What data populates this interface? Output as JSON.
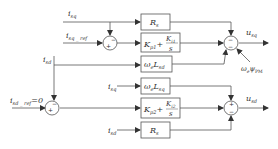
{
  "diagram": {
    "type": "block-diagram",
    "colors": {
      "line": "#555555",
      "text": "#333333",
      "box_border": "#666666"
    },
    "inputs": {
      "isq_top": {
        "main": "i",
        "sub": "sq"
      },
      "isq_ref": {
        "main": "i",
        "sub": "sq _ ref"
      },
      "isd_left": {
        "main": "i",
        "sub": "sd"
      },
      "isd_ref": {
        "main": "i",
        "sub": "sd _ ref",
        "suffix": "=0"
      },
      "isq_mid": {
        "main": "i",
        "sub": "sq"
      },
      "isd_bottom": {
        "main": "i",
        "sub": "sd"
      }
    },
    "blocks": {
      "rs_q": {
        "main": "R",
        "sub": "s"
      },
      "pi_q": {
        "kp": "K",
        "kp_sub": "p1",
        "plus": "+",
        "ki": "K",
        "ki_sub": "i1",
        "den": "s"
      },
      "we_lsd": {
        "w": "ω",
        "w_sub": "e",
        "l": "L",
        "l_sub": "sd"
      },
      "we_lsq": {
        "w": "ω",
        "w_sub": "e",
        "l": "L",
        "l_sub": "sq"
      },
      "pi_d": {
        "kp": "K",
        "kp_sub": "p2",
        "plus": "+",
        "ki": "K",
        "ki_sub": "i2",
        "den": "s"
      },
      "rs_d": {
        "main": "R",
        "sub": "s"
      }
    },
    "summers": {
      "q_err": {
        "signs": [
          "+",
          "−"
        ]
      },
      "d_err": {
        "signs": [
          "+",
          "−"
        ]
      },
      "q_out": {
        "signs": [
          "−",
          "−"
        ]
      },
      "d_out": {
        "signs": [
          "+",
          "−"
        ]
      }
    },
    "feedforward": {
      "w": "ω",
      "w_sub": "e",
      "psi": "ψ",
      "psi_sub": "PM"
    },
    "outputs": {
      "usq": {
        "main": "u",
        "sub": "sq"
      },
      "usd": {
        "main": "u",
        "sub": "sd"
      }
    }
  }
}
